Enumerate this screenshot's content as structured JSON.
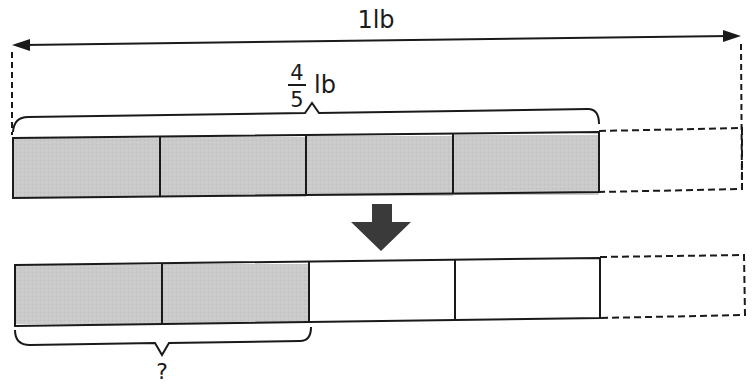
{
  "diagram": {
    "type": "bar-model",
    "whole_label": "1lb",
    "top_bar": {
      "brace_label": {
        "numerator": "4",
        "denominator": "5",
        "unit": "lb"
      },
      "total_parts": 5,
      "shaded_parts": 4
    },
    "bottom_bar": {
      "brace_label": "?",
      "total_parts": 5,
      "shaded_parts": 2
    },
    "colors": {
      "shaded": "#c8c8c8",
      "stroke": "#1a1a1a",
      "arrow": "#3a3a3a",
      "background": "#ffffff"
    }
  }
}
